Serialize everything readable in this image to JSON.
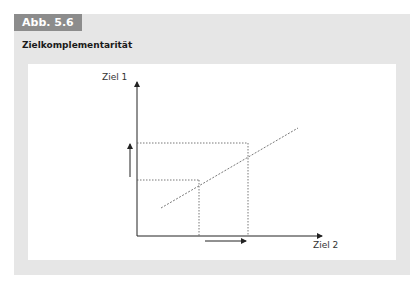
{
  "figure": {
    "tag": "Abb. 5.6",
    "title": "Zielkomplementarität"
  },
  "diagram": {
    "y_axis_label": "Ziel 1",
    "x_axis_label": "Ziel 2",
    "points": [
      {
        "name": "lower-point",
        "x": 199,
        "y": 180
      },
      {
        "name": "upper-point",
        "x": 248,
        "y": 143
      }
    ],
    "colors": {
      "tag_bg": "#8c8c8c",
      "frame_bg": "#e6e6e6",
      "line": "#555555"
    }
  }
}
